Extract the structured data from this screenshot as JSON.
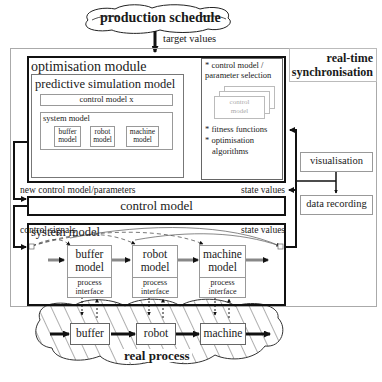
{
  "production_schedule": {
    "label": "production schedule"
  },
  "target_values_label": "target values",
  "realtime_sync": {
    "label_line1": "real-time",
    "label_line2": "synchronisation"
  },
  "optimisation_module": {
    "title": "optimisation module",
    "predictive_model": {
      "title": "predictive simulation model",
      "control_model_x": "control model x",
      "system_model": {
        "title": "system model",
        "components": [
          "buffer model",
          "robot model",
          "machine model"
        ]
      }
    },
    "selection_panel": {
      "item1_line1": "* control model /",
      "item1_line2": "parameter selection",
      "stack_card_line1": "control",
      "stack_card_line2": "model",
      "item2": "* fitness functions",
      "item3_line1": "* optimisation",
      "item3_line2": "algorithms"
    }
  },
  "new_control_label": "new control model/parameters",
  "state_values_label_upper": "state values",
  "control_model": {
    "label": "control model"
  },
  "control_signals_label": "control signals",
  "state_values_label_lower": "state values",
  "visualisation": {
    "label": "visualisation"
  },
  "data_recording": {
    "label": "data recording"
  },
  "system_model": {
    "title": "system model",
    "components": [
      {
        "name_line1": "buffer",
        "name_line2": "model",
        "iface_line1": "process",
        "iface_line2": "interface"
      },
      {
        "name_line1": "robot",
        "name_line2": "model",
        "iface_line1": "process",
        "iface_line2": "interface"
      },
      {
        "name_line1": "machine",
        "name_line2": "model",
        "iface_line1": "process",
        "iface_line2": "interface"
      }
    ]
  },
  "real_process": {
    "label": "real process",
    "components": [
      "buffer",
      "robot",
      "machine"
    ]
  }
}
